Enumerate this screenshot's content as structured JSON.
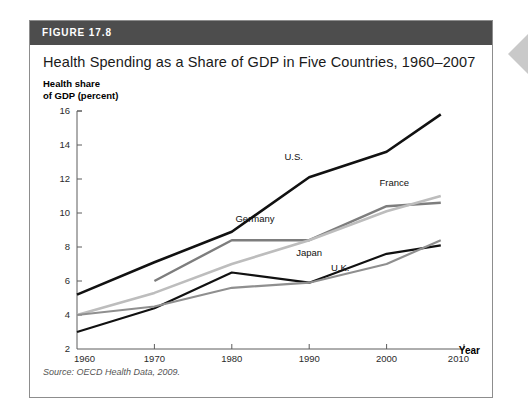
{
  "figure": {
    "header_label": "FIGURE 17.8",
    "title": "Health Spending as a Share of GDP in Five Countries, 1960–2007",
    "source": "Source: OECD Health Data, 2009.",
    "header_bg": "#4d4d4d",
    "card_border": "#8d8d8d"
  },
  "chart_data": {
    "type": "line",
    "title": "Health Spending as a Share of GDP in Five Countries, 1960–2007",
    "subtitle": "",
    "xlabel": "Year",
    "ylabel": "Health share\nof GDP (percent)",
    "xlim": [
      1960,
      2010
    ],
    "ylim": [
      2,
      16
    ],
    "xticks": [
      1960,
      1970,
      1980,
      1990,
      2000,
      2010
    ],
    "xtick_labels": [
      "1960",
      "1970",
      "1980",
      "1990",
      "2000",
      "2010"
    ],
    "yticks": [
      2,
      4,
      6,
      8,
      10,
      12,
      14,
      16
    ],
    "ytick_labels": [
      "2",
      "4",
      "6",
      "8",
      "10",
      "12",
      "14",
      "16"
    ],
    "grid": false,
    "legend_position": "inline-labels",
    "annotations": [
      "U.S.",
      "France",
      "Germany",
      "Japan",
      "U.K."
    ],
    "series": [
      {
        "name": "U.S.",
        "color": "#111111",
        "width": 2.6,
        "label_x": 1988,
        "label_y": 13.1,
        "x": [
          1960,
          1970,
          1980,
          1990,
          2000,
          2007
        ],
        "values": [
          5.2,
          7.1,
          8.9,
          12.1,
          13.6,
          15.8
        ]
      },
      {
        "name": "Germany",
        "color": "#7d7d7d",
        "width": 2.4,
        "label_x": 1983,
        "label_y": 9.5,
        "x": [
          1970,
          1980,
          1990,
          2000,
          2007
        ],
        "values": [
          6.0,
          8.4,
          8.4,
          10.4,
          10.6
        ]
      },
      {
        "name": "France",
        "color": "#bdbdbd",
        "width": 2.6,
        "label_x": 2001,
        "label_y": 11.6,
        "x": [
          1960,
          1970,
          1980,
          1990,
          2000,
          2007
        ],
        "values": [
          4.0,
          5.3,
          7.0,
          8.4,
          10.1,
          11.0
        ]
      },
      {
        "name": "Japan",
        "color": "#111111",
        "width": 2.2,
        "label_x": 1990,
        "label_y": 7.5,
        "x": [
          1960,
          1970,
          1980,
          1990,
          2000,
          2007
        ],
        "values": [
          3.0,
          4.4,
          6.5,
          5.9,
          7.6,
          8.1
        ],
        "note": "dark lower line"
      },
      {
        "name": "U.K.",
        "color": "#8f8f8f",
        "width": 2.2,
        "label_x": 1994,
        "label_y": 6.6,
        "x": [
          1960,
          1970,
          1980,
          1990,
          2000,
          2007
        ],
        "values": [
          4.0,
          4.5,
          5.6,
          5.9,
          7.0,
          8.4
        ],
        "note": "gray lower line"
      }
    ]
  },
  "side_marker": {
    "name": "chevron-left",
    "color": "#c9c9c9"
  }
}
